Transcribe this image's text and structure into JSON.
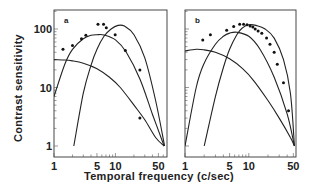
{
  "chart_data": [
    {
      "type": "line",
      "panel": "a",
      "panel_label": "a",
      "xscale": "log",
      "yscale": "log",
      "xlim": [
        1,
        69
      ],
      "ylim": [
        1,
        210
      ],
      "xticks": [
        1,
        5,
        10,
        50
      ],
      "yticks": [
        1,
        10,
        100
      ],
      "xlabel": "Temporal frequency (c/sec)",
      "ylabel": "Contrast sensitivity",
      "series": [
        {
          "name": "low-pass mechanism",
          "x": [
            1,
            1.5,
            2,
            3,
            5,
            8,
            12,
            20,
            30,
            45,
            62
          ],
          "y": [
            30,
            29.5,
            28.5,
            26,
            21,
            15,
            10,
            5,
            2.8,
            1.4,
            1
          ]
        },
        {
          "name": "mid mechanism",
          "x": [
            1,
            1.5,
            2,
            3,
            4,
            5,
            6.5,
            10,
            15,
            25,
            40,
            62
          ],
          "y": [
            7,
            25,
            45,
            68,
            78,
            80,
            79,
            65,
            40,
            14,
            3.5,
            1
          ]
        },
        {
          "name": "high mechanism",
          "x": [
            2.1,
            3,
            4,
            5,
            6.5,
            8.5,
            11,
            14,
            20,
            30,
            45,
            63
          ],
          "y": [
            1,
            8,
            24,
            45,
            75,
            100,
            115,
            112,
            80,
            32,
            6,
            1
          ]
        },
        {
          "name": "data",
          "style": "points",
          "x": [
            1.4,
            2,
            2.8,
            3.3,
            5.2,
            6.4,
            7.1,
            9.9,
            14.5,
            25,
            25
          ],
          "y": [
            45,
            52,
            68,
            78,
            120,
            120,
            105,
            80,
            43,
            20,
            3
          ]
        }
      ]
    },
    {
      "type": "line",
      "panel": "b",
      "panel_label": "b",
      "xscale": "log",
      "yscale": "log",
      "xlim": [
        1,
        55
      ],
      "ylim": [
        1,
        210
      ],
      "xticks": [
        1,
        5,
        10,
        50
      ],
      "yticks": [
        1,
        10,
        100
      ],
      "xlabel": "Temporal frequency (c/sec)",
      "ylabel": "Contrast sensitivity",
      "series": [
        {
          "name": "low-pass mechanism",
          "x": [
            1,
            1.5,
            2,
            3,
            5,
            8,
            12,
            20,
            30,
            45,
            52
          ],
          "y": [
            42,
            45,
            44,
            40,
            31,
            21,
            13,
            6,
            3,
            1.4,
            1
          ]
        },
        {
          "name": "mid mechanism",
          "x": [
            1,
            1.5,
            2,
            3,
            4,
            5,
            6.5,
            10,
            15,
            25,
            40,
            52
          ],
          "y": [
            1,
            10,
            26,
            55,
            75,
            85,
            88,
            75,
            45,
            15,
            3.5,
            1
          ]
        },
        {
          "name": "high mechanism",
          "x": [
            2,
            3,
            4,
            5,
            6.5,
            8,
            10,
            13,
            18,
            25,
            35,
            45,
            52
          ],
          "y": [
            1,
            7,
            22,
            45,
            80,
            105,
            118,
            115,
            100,
            70,
            30,
            8,
            1
          ]
        },
        {
          "name": "data",
          "style": "points",
          "x": [
            1.9,
            2.5,
            4.5,
            5.8,
            7.2,
            8.3,
            9.4,
            10.5,
            11.6,
            12.6,
            14,
            16,
            19,
            21.5,
            25,
            28,
            35,
            42
          ],
          "y": [
            65,
            80,
            95,
            110,
            120,
            120,
            118,
            112,
            108,
            100,
            92,
            85,
            70,
            55,
            40,
            25,
            12,
            4
          ]
        }
      ]
    }
  ],
  "labels": {
    "ylabel": "Contrast sensitivity",
    "xlabel": "Temporal frequency (c/sec)",
    "panel_a": "a",
    "panel_b": "b",
    "yticks": [
      "100",
      "10",
      "1"
    ],
    "xticks": [
      "1",
      "5",
      "10",
      "50"
    ]
  }
}
